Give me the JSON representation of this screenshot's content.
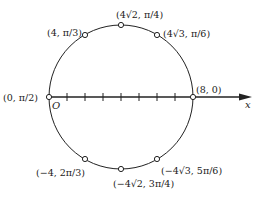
{
  "diagram": {
    "type": "polar-circle",
    "axis": {
      "label": "x",
      "origin_label": "O",
      "tick_count": 7
    },
    "points": [
      {
        "id": "p-origin",
        "label": "(0, π/2)",
        "x": 49,
        "y": 97,
        "label_x": 3,
        "label_y": 100
      },
      {
        "id": "p-8-0",
        "label": "(8, 0)",
        "x": 193,
        "y": 97,
        "label_x": 196,
        "label_y": 94
      },
      {
        "id": "p-4-pi3",
        "label": "(4, π/3)",
        "x": 85,
        "y": 35,
        "label_x": 47,
        "label_y": 34
      },
      {
        "id": "p-4r2-pi4",
        "label": "(4√2, π/4)",
        "x": 121,
        "y": 25,
        "label_x": 117,
        "label_y": 19
      },
      {
        "id": "p-4r3-pi6",
        "label": "(4√3, π/6)",
        "x": 157,
        "y": 35,
        "label_x": 163,
        "label_y": 36
      },
      {
        "id": "p-m4-2pi3",
        "label": "(−4, 2π/3)",
        "x": 85,
        "y": 159,
        "label_x": 37,
        "label_y": 167
      },
      {
        "id": "p-m4r2-3pi4",
        "label": "(−4√2, 3π/4)",
        "x": 121,
        "y": 169,
        "label_x": 113,
        "label_y": 187
      },
      {
        "id": "p-m4r3-5pi6",
        "label": "(−4√3, 5π/6)",
        "x": 157,
        "y": 159,
        "label_x": 161,
        "label_y": 171
      }
    ],
    "colors": {
      "stroke": "#222222",
      "background": "#ffffff"
    }
  }
}
